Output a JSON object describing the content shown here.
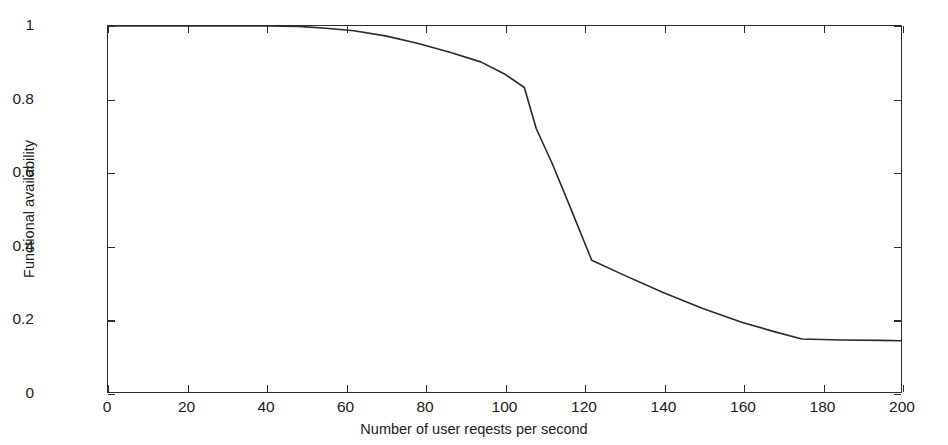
{
  "chart_data": {
    "type": "line",
    "title": "",
    "subtitle": "",
    "xlabel": "Number of user reqests per second",
    "ylabel": "Functional availability",
    "xlim": [
      0,
      200
    ],
    "ylim": [
      0,
      1
    ],
    "grid": false,
    "legend": null,
    "legend_position": "none",
    "line_color": "#2b2b2b",
    "xticks": [
      0,
      20,
      40,
      60,
      80,
      100,
      120,
      140,
      160,
      180,
      200
    ],
    "xtick_labels": [
      "0",
      "20",
      "40",
      "60",
      "80",
      "100",
      "120",
      "140",
      "160",
      "180",
      "200"
    ],
    "yticks": [
      0,
      0.2,
      0.4,
      0.6,
      0.8,
      1
    ],
    "ytick_labels": [
      "0",
      "0.2",
      "0.4",
      "0.6",
      "0.8",
      "1"
    ],
    "series": [
      {
        "name": "Functional availability",
        "x": [
          0,
          10,
          20,
          30,
          40,
          48,
          55,
          62,
          70,
          78,
          86,
          94,
          100,
          105,
          108,
          112,
          116,
          122,
          130,
          140,
          150,
          160,
          168,
          175,
          185,
          195,
          200
        ],
        "values": [
          1.0,
          1.0,
          1.0,
          1.0,
          1.0,
          0.999,
          0.994,
          0.987,
          0.973,
          0.953,
          0.929,
          0.902,
          0.869,
          0.832,
          0.72,
          0.625,
          0.52,
          0.36,
          0.32,
          0.272,
          0.228,
          0.19,
          0.165,
          0.145,
          0.142,
          0.141,
          0.14
        ]
      }
    ],
    "annotations": []
  },
  "axis": {
    "x_title": "Number of user reqests per second",
    "y_title": "Functional availability"
  }
}
